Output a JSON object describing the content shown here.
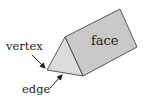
{
  "diagram": {
    "type": "triangular-prism",
    "labels": {
      "face": "face",
      "vertex": "vertex",
      "edge": "edge"
    },
    "colors": {
      "front_face": "#dcdcdc",
      "side_face": "#c9c9c9",
      "stroke": "#333333",
      "background": "#ffffff"
    }
  }
}
